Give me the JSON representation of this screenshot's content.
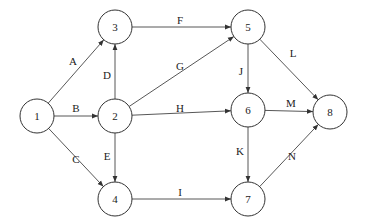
{
  "diagram": {
    "type": "activity-network",
    "node_radius": 17,
    "nodes": [
      {
        "id": "1",
        "label": "1",
        "x": 37,
        "y": 116
      },
      {
        "id": "2",
        "label": "2",
        "x": 115,
        "y": 116
      },
      {
        "id": "3",
        "label": "3",
        "x": 115,
        "y": 27
      },
      {
        "id": "4",
        "label": "4",
        "x": 115,
        "y": 199
      },
      {
        "id": "5",
        "label": "5",
        "x": 248,
        "y": 27
      },
      {
        "id": "6",
        "label": "6",
        "x": 248,
        "y": 110
      },
      {
        "id": "7",
        "label": "7",
        "x": 248,
        "y": 199
      },
      {
        "id": "8",
        "label": "8",
        "x": 330,
        "y": 112
      }
    ],
    "edges": [
      {
        "label": "A",
        "from": "1",
        "to": "3",
        "lx": 73,
        "ly": 62
      },
      {
        "label": "B",
        "from": "1",
        "to": "2",
        "lx": 76,
        "ly": 109
      },
      {
        "label": "C",
        "from": "1",
        "to": "4",
        "lx": 76,
        "ly": 160
      },
      {
        "label": "D",
        "from": "2",
        "to": "3",
        "lx": 107,
        "ly": 76
      },
      {
        "label": "E",
        "from": "2",
        "to": "4",
        "lx": 107,
        "ly": 157
      },
      {
        "label": "F",
        "from": "3",
        "to": "5",
        "lx": 180,
        "ly": 21
      },
      {
        "label": "G",
        "from": "2",
        "to": "5",
        "lx": 180,
        "ly": 67
      },
      {
        "label": "H",
        "from": "2",
        "to": "6",
        "lx": 180,
        "ly": 109
      },
      {
        "label": "I",
        "from": "4",
        "to": "7",
        "lx": 180,
        "ly": 193
      },
      {
        "label": "J",
        "from": "5",
        "to": "6",
        "lx": 241,
        "ly": 72
      },
      {
        "label": "K",
        "from": "6",
        "to": "7",
        "lx": 240,
        "ly": 152
      },
      {
        "label": "L",
        "from": "5",
        "to": "8",
        "lx": 293,
        "ly": 54
      },
      {
        "label": "M",
        "from": "6",
        "to": "8",
        "lx": 291,
        "ly": 104
      },
      {
        "label": "N",
        "from": "7",
        "to": "8",
        "lx": 292,
        "ly": 157
      }
    ]
  }
}
